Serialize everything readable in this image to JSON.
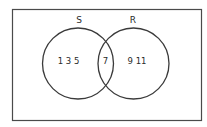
{
  "venn": {
    "universal_set": {
      "label": ""
    },
    "sets": [
      {
        "id": "S",
        "label": "S",
        "only_elements": "1 3 5"
      },
      {
        "id": "R",
        "label": "R",
        "only_elements": "9 11"
      }
    ],
    "intersection": {
      "sets": [
        "S",
        "R"
      ],
      "elements": "7"
    }
  },
  "colors": {
    "stroke": "#3a3a3a",
    "text": "#2a2a2a",
    "background": "#ffffff"
  }
}
